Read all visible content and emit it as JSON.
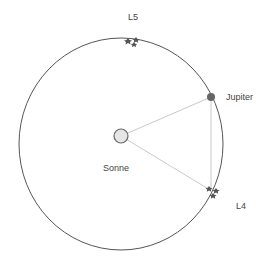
{
  "diagram": {
    "labels": {
      "sun": "Sonne",
      "planet": "Jupiter",
      "l4": "L4",
      "l5": "L5"
    },
    "colors": {
      "orbit": "#555555",
      "lines": "#bbbbbb",
      "sun_fill": "#e6e6e6",
      "sun_stroke": "#666666",
      "planet": "#666666",
      "asteroids": "#555555",
      "text": "#444444"
    }
  }
}
